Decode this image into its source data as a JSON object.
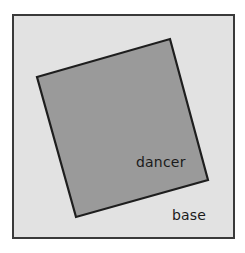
{
  "figure": {
    "name": "rotated-square-diagram",
    "canvas": {
      "width": 245,
      "height": 253,
      "background": "#ffffff"
    },
    "frame": {
      "label": "base",
      "x": 12,
      "y": 14,
      "width": 223,
      "height": 225,
      "fill": "#e2e2e2",
      "stroke": "#3a3a3a",
      "stroke_width": 2
    },
    "shape": {
      "label": "dancer",
      "type": "rotated-square",
      "fill": "#9a9a9a",
      "stroke": "#1e1e1e",
      "stroke_width": 2.2,
      "rotation_degrees": 16,
      "vertices": [
        {
          "name": "left",
          "x": 37,
          "y": 77
        },
        {
          "name": "top",
          "x": 170,
          "y": 39
        },
        {
          "name": "right",
          "x": 208,
          "y": 180
        },
        {
          "name": "bottom",
          "x": 76,
          "y": 217
        }
      ]
    },
    "labels": [
      {
        "id": "dancer",
        "text": "dancer",
        "x": 136,
        "y": 167,
        "color": "#1a1a1a",
        "font_size": 14
      },
      {
        "id": "base",
        "text": "base",
        "x": 172,
        "y": 220,
        "color": "#1a1a1a",
        "font_size": 14
      }
    ]
  }
}
